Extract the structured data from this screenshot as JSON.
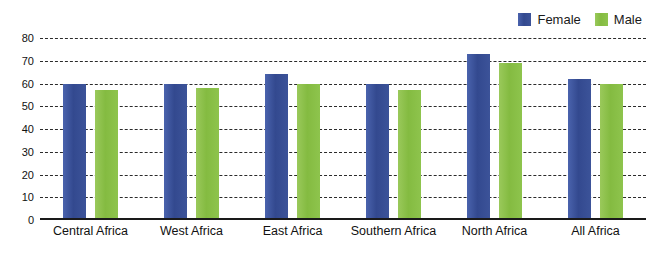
{
  "chart_data": {
    "type": "bar",
    "title": "",
    "xlabel": "",
    "ylabel": "",
    "ylim": [
      0,
      80
    ],
    "yticks": [
      80,
      70,
      60,
      50,
      40,
      30,
      20,
      10,
      0
    ],
    "grid": true,
    "legend_position": "top-right",
    "categories": [
      "Central Africa",
      "West Africa",
      "East Africa",
      "Southern Africa",
      "North Africa",
      "All Africa"
    ],
    "series": [
      {
        "name": "Female",
        "color": "#3c5399",
        "values": [
          60,
          60,
          64,
          60,
          73,
          62
        ]
      },
      {
        "name": "Male",
        "color": "#8ec44d",
        "values": [
          57,
          58,
          60,
          57,
          69,
          60
        ]
      }
    ]
  },
  "legend": {
    "items": [
      {
        "label": "Female",
        "color": "#3c5399"
      },
      {
        "label": "Male",
        "color": "#8ec44d"
      }
    ]
  },
  "colors": {
    "female": "#3c5399",
    "male": "#8ec44d",
    "gridline": "#2b2b2b",
    "axis": "#1a1a1a",
    "text": "#111111",
    "background": "#ffffff"
  }
}
